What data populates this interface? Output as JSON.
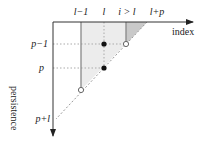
{
  "diagram": {
    "axes": {
      "x_label": "index",
      "y_label": "persistence"
    },
    "top_labels": [
      "l−1",
      "l",
      "i > l",
      "l+p"
    ],
    "left_labels": [
      "p−1",
      "p",
      "p+l"
    ],
    "colors": {
      "axis": "#333333",
      "light_region": "#ebebeb",
      "dark_region": "#c8c8c8",
      "guide": "#aaaaaa",
      "point_filled": "#111111",
      "point_open": "#ffffff"
    },
    "points": [
      {
        "kind": "filled",
        "column": "l",
        "row": "p−1"
      },
      {
        "kind": "filled",
        "column": "l",
        "row": "p"
      },
      {
        "kind": "open",
        "column": "i > l",
        "row": "p−1"
      },
      {
        "kind": "open",
        "column": "l−1",
        "row": "p+l"
      }
    ]
  }
}
